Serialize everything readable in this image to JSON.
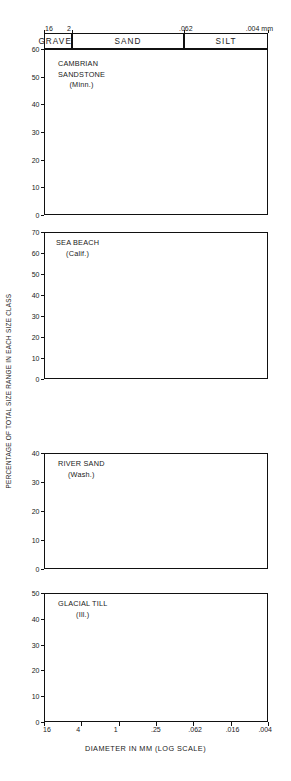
{
  "figure": {
    "ylabel": "PERCENTAGE OF TOTAL SIZE RANGE IN EACH SIZE CLASS",
    "xlabel": "DIAMETER IN MM (LOG SCALE)",
    "bar_color": "#5b5b5b",
    "axis_color": "#111111",
    "background": "#ffffff"
  },
  "header": {
    "unit": "mm",
    "scale_ticks": [
      {
        "label": "16",
        "pos": 0
      },
      {
        "label": "2",
        "pos": 0.125
      },
      {
        "label": ".062",
        "pos": 0.625
      },
      {
        "label": ".004",
        "pos": 1.0
      }
    ],
    "bands": [
      {
        "label": "GRAVEL",
        "start": 0.0,
        "end": 0.125
      },
      {
        "label": "SAND",
        "start": 0.125,
        "end": 0.625
      },
      {
        "label": "SILT",
        "start": 0.625,
        "end": 1.0
      }
    ]
  },
  "xaxis": {
    "ticks": [
      {
        "label": "16",
        "pos": 0.0
      },
      {
        "label": "4",
        "pos": 0.16667
      },
      {
        "label": "1",
        "pos": 0.33333
      },
      {
        "label": ".25",
        "pos": 0.5
      },
      {
        "label": ".062",
        "pos": 0.66667
      },
      {
        "label": ".016",
        "pos": 0.83333
      },
      {
        "label": ".004",
        "pos": 1.0
      }
    ]
  },
  "chart_data": [
    {
      "type": "bar",
      "id": "cambrian-sandstone",
      "title": "CAMBRIAN SANDSTONE",
      "title_line1": "CAMBRIAN",
      "title_line2": "SANDSTONE",
      "subtitle": "(Minn.)",
      "ylabel": "PERCENTAGE OF TOTAL SIZE RANGE IN EACH SIZE CLASS",
      "xlabel": "DIAMETER IN MM (LOG SCALE)",
      "ylim": [
        0,
        60
      ],
      "yticks": [
        0,
        10,
        20,
        30,
        40,
        50,
        60
      ],
      "grid": false,
      "xscale": "log",
      "bin_edges_mm": [
        16,
        8,
        4,
        2,
        1,
        0.5,
        0.25,
        0.125,
        0.062,
        0.031,
        0.016,
        0.008,
        0.004
      ],
      "bin_labels": [
        "16-8",
        "8-4",
        "4-2",
        "2-1",
        "1-.5",
        ".5-.25",
        ".25-.125",
        ".125-.062",
        ".062-.031",
        ".031-.016",
        ".016-.008",
        ".008-.004"
      ],
      "values": [
        0,
        0,
        0,
        0,
        0,
        1.5,
        17.5,
        56.5,
        23,
        3,
        0,
        0
      ]
    },
    {
      "type": "bar",
      "id": "sea-beach",
      "title": "SEA BEACH",
      "title_line1": "SEA BEACH",
      "subtitle": "(Calif.)",
      "ylim": [
        0,
        70
      ],
      "yticks": [
        0,
        10,
        20,
        30,
        40,
        50,
        60,
        70
      ],
      "grid": false,
      "xscale": "log",
      "bin_edges_mm": [
        16,
        8,
        4,
        2,
        1,
        0.5,
        0.25,
        0.125,
        0.062,
        0.031,
        0.016,
        0.008,
        0.004
      ],
      "bin_labels": [
        "16-8",
        "8-4",
        "4-2",
        "2-1",
        "1-.5",
        ".5-.25",
        ".25-.125",
        ".125-.062",
        ".062-.031",
        ".031-.016",
        ".016-.008",
        ".008-.004"
      ],
      "values": [
        0,
        0,
        0,
        0,
        0,
        1,
        27,
        71.5,
        2,
        2,
        0,
        0
      ]
    },
    {
      "type": "bar",
      "id": "river-sand",
      "title": "RIVER SAND",
      "title_line1": "RIVER SAND",
      "subtitle": "(Wash.)",
      "ylim": [
        0,
        40
      ],
      "yticks": [
        0,
        10,
        20,
        30,
        40
      ],
      "grid": false,
      "xscale": "log",
      "bin_edges_mm": [
        16,
        8,
        4,
        2,
        1,
        0.5,
        0.25,
        0.125,
        0.062,
        0.031,
        0.016,
        0.008,
        0.004
      ],
      "bin_labels": [
        "16-8",
        "8-4",
        "4-2",
        "2-1",
        "1-.5",
        ".5-.25",
        ".25-.125",
        ".125-.062",
        ".062-.031",
        ".031-.016",
        ".016-.008",
        ".008-.004"
      ],
      "values": [
        0,
        0,
        0,
        2,
        6,
        14.5,
        11.5,
        20.5,
        32.5,
        3.5,
        1.5,
        1.5
      ]
    },
    {
      "type": "bar",
      "id": "glacial-till",
      "title": "GLACIAL TILL",
      "title_line1": "GLACIAL TILL",
      "subtitle": "(Ill.)",
      "ylim": [
        0,
        50
      ],
      "yticks": [
        0,
        10,
        20,
        30,
        40,
        50
      ],
      "grid": false,
      "xscale": "log",
      "bin_edges_mm": [
        16,
        8,
        4,
        2,
        1,
        0.5,
        0.25,
        0.125,
        0.062,
        0.031,
        0.016,
        0.008,
        0.004
      ],
      "bin_labels": [
        "16-8",
        "8-4",
        "4-2",
        "2-1",
        "1-.5",
        ".5-.25",
        ".25-.125",
        ".125-.062",
        ".062-.031",
        ".031-.016",
        ".016-.008",
        ".008-.004"
      ],
      "values": [
        5,
        12.5,
        5,
        4,
        6,
        12,
        6.5,
        4.5,
        20,
        8.5,
        4.5,
        2.5
      ]
    }
  ],
  "layout": {
    "panels": [
      {
        "id": "cambrian-sandstone",
        "top": 49,
        "height": 166,
        "caption_top": 10,
        "caption_left": 14
      },
      {
        "id": "sea-beach",
        "top": 232,
        "height": 147,
        "caption_top": 6,
        "caption_left": 12
      },
      {
        "id": "river-sand",
        "top": 453,
        "height": 116,
        "caption_top": 6,
        "caption_left": 14
      },
      {
        "id": "glacial-till",
        "top": 593,
        "height": 129,
        "caption_top": 6,
        "caption_left": 14
      }
    ],
    "plot_left": 44,
    "plot_width": 224
  }
}
